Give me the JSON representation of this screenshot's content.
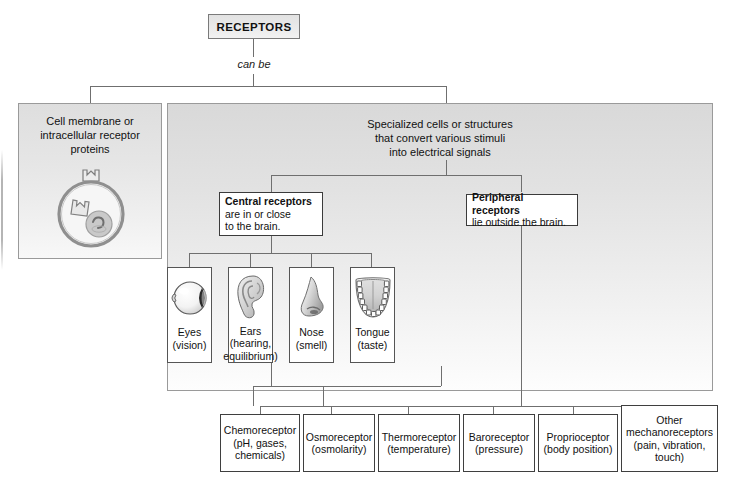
{
  "diagram": {
    "root": {
      "label": "RECEPTORS"
    },
    "connector_label": "can be",
    "branches": {
      "left": {
        "title": "Cell membrane or\nintracellular receptor\nproteins",
        "title_lines": [
          "Cell membrane or",
          "intracellular receptor",
          "proteins"
        ],
        "art": "cell-receptor-icon"
      },
      "right": {
        "title_lines": [
          "Specialized cells or structures",
          "that convert various stimuli",
          "into electrical signals"
        ],
        "categories": [
          {
            "id": "central",
            "header": "Central receptors",
            "sub_lines": [
              "are in or close",
              "to the brain."
            ]
          },
          {
            "id": "peripheral",
            "header": "Peripheral receptors",
            "sub_lines": [
              "lie outside the brain."
            ]
          }
        ],
        "organs": [
          {
            "id": "eyes",
            "art": "eye-icon",
            "lines": [
              "Eyes",
              "(vision)"
            ]
          },
          {
            "id": "ears",
            "art": "ear-icon",
            "lines": [
              "Ears",
              "(hearing,",
              "equilibrium)"
            ]
          },
          {
            "id": "nose",
            "art": "nose-icon",
            "lines": [
              "Nose",
              "(smell)"
            ]
          },
          {
            "id": "tongue",
            "art": "tongue-icon",
            "lines": [
              "Tongue",
              "(taste)"
            ]
          }
        ],
        "receptor_types": [
          {
            "id": "chemoreceptor",
            "lines": [
              "Chemoreceptor",
              "(pH, gases,",
              "chemicals)"
            ]
          },
          {
            "id": "osmoreceptor",
            "lines": [
              "Osmoreceptor",
              "(osmolarity)"
            ]
          },
          {
            "id": "thermoreceptor",
            "lines": [
              "Thermoreceptor",
              "(temperature)"
            ]
          },
          {
            "id": "baroreceptor",
            "lines": [
              "Baroreceptor",
              "(pressure)"
            ]
          },
          {
            "id": "proprioceptor",
            "lines": [
              "Proprioceptor",
              "(body position)"
            ]
          },
          {
            "id": "other-mechano",
            "lines": [
              "Other",
              "mechanoreceptors",
              "(pain, vibration,",
              "touch)"
            ]
          }
        ]
      }
    },
    "colors": {
      "line": "#6f6f6f",
      "box_border": "#4d4d4d",
      "panel_border": "#9a9a9a",
      "panel_top_gray": "#d9d9d9",
      "text": "#111111"
    }
  }
}
